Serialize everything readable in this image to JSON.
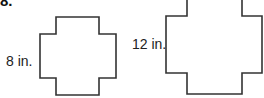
{
  "problem": {
    "number": "8.",
    "figures": [
      {
        "label": "8 in.",
        "shape": "plus-shaped polygon (cross)"
      },
      {
        "label": "12 in.",
        "shape": "plus-shaped polygon (cross), larger"
      }
    ]
  },
  "colors": {
    "stroke": "#333333",
    "text": "#222222"
  }
}
